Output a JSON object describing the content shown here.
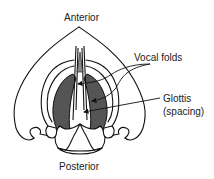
{
  "diagram": {
    "type": "anatomical-illustration",
    "labels": {
      "anterior": "Anterior",
      "posterior": "Posterior",
      "vocal_folds": "Vocal folds",
      "glottis_line1": "Glottis",
      "glottis_line2": "(spacing)"
    },
    "colors": {
      "stroke": "#111111",
      "fold_fill": "#555555",
      "tissue_fill": "#ffffff",
      "epiglottis_tip": "#888888"
    }
  }
}
